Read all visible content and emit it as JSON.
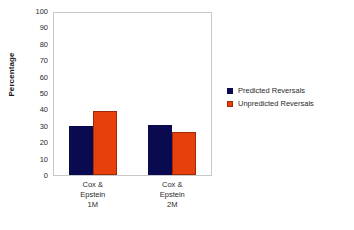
{
  "chart_data": {
    "type": "bar",
    "title": "",
    "xlabel": "",
    "ylabel": "Percentage",
    "ylim": [
      0,
      100
    ],
    "ytick_step": 10,
    "yticks": [
      100,
      90,
      80,
      70,
      60,
      50,
      40,
      30,
      20,
      10,
      0
    ],
    "grid": false,
    "legend_position": "right",
    "categories": [
      "Cox & Epstein 1M",
      "Cox & Epstein 2M"
    ],
    "category_lines": [
      [
        "Cox &",
        "Epstein",
        "1M"
      ],
      [
        "Cox &",
        "Epstein",
        "2M"
      ]
    ],
    "series": [
      {
        "name": "Predicted Reversals",
        "color": "#0a0a50",
        "values": [
          30,
          30.5
        ]
      },
      {
        "name": "Unpredicted Reversals",
        "color": "#e8400c",
        "values": [
          39,
          26
        ]
      }
    ]
  },
  "legend": {
    "items": [
      {
        "label": "Predicted Reversals"
      },
      {
        "label": "Unpredicted Reversals"
      }
    ]
  }
}
